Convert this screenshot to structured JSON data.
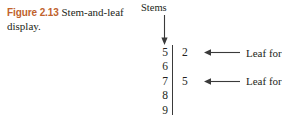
{
  "caption": {
    "figure_label": "Figure 2.13",
    "text": "Stem-and-leaf display."
  },
  "diagram": {
    "stems_header": "Stems",
    "stems_arrow_icon": "arrow-down-icon",
    "divider_icon": "vertical-rule",
    "rows": [
      {
        "stem": "5",
        "leaf": "2",
        "annotation": "Leaf for 52",
        "arrow_icon": "arrow-left-icon"
      },
      {
        "stem": "6",
        "leaf": "",
        "annotation": "",
        "arrow_icon": ""
      },
      {
        "stem": "7",
        "leaf": "5",
        "annotation": "Leaf for 75",
        "arrow_icon": "arrow-left-icon"
      },
      {
        "stem": "8",
        "leaf": "",
        "annotation": "",
        "arrow_icon": ""
      },
      {
        "stem": "9",
        "leaf": "",
        "annotation": "",
        "arrow_icon": ""
      }
    ]
  },
  "colors": {
    "figure_label": "#c0622c",
    "text": "#231f20",
    "rule": "#3a3a3a",
    "background": "#ffffff"
  }
}
